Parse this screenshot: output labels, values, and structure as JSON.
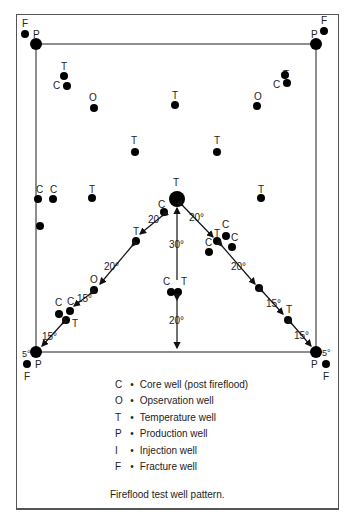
{
  "diagram": {
    "title": "Fireflood test well pattern.",
    "legend": [
      {
        "key": "C",
        "label": "Core well (post fireflood)"
      },
      {
        "key": "O",
        "label": "Opservation well"
      },
      {
        "key": "T",
        "label": "Temperature well"
      },
      {
        "key": "P",
        "label": "Production well"
      },
      {
        "key": "I",
        "label": "Injection well"
      },
      {
        "key": "F",
        "label": "Fracture well"
      }
    ],
    "bullet": "•",
    "corner_labels": {
      "production": "P",
      "fracture": "F",
      "angle": "5°"
    },
    "distance_labels": [
      "20",
      "20°",
      "20°",
      "15°",
      "15°",
      "20°",
      "20°",
      "15°",
      "15°",
      "30°",
      "20°"
    ]
  }
}
